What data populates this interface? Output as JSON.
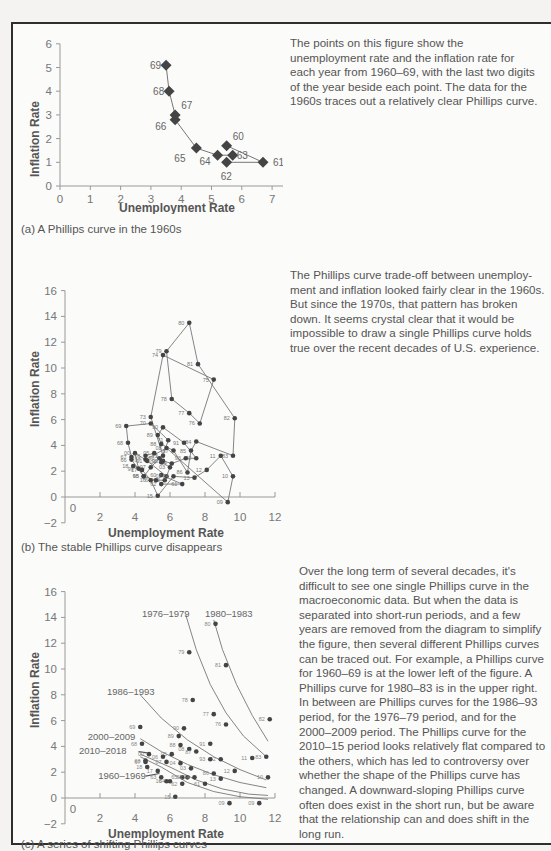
{
  "panels": [
    {
      "id": "a",
      "caption": "(a)  A Phillips curve in the 1960s",
      "description": "The points on this figure show the unemployment rate and the inflation rate for each year from 1960–69, with the last two digits of the year beside each point. The data for the 1960s traces out a relatively clear Phillips curve."
    },
    {
      "id": "b",
      "caption": "(b) The stable Phillips curve disappears",
      "description": "The Phillips curve trade-off between unemploy-ment and inflation looked fairly clear in the 1960s. But since the 1970s, that pattern has broken down. It seems crystal clear that it would be impossible to draw a single Phillips curve holds true over the recent decades of U.S. experience."
    },
    {
      "id": "c",
      "caption": "(c) A series of shifting Phillips curves",
      "description": "Over the long term of several decades, it's difficult to see one single Phillips curve in the macroeconomic data. But when the data is separated into short-run periods, and a few years are removed from the diagram to simplify the figure, then several different Phillips curves can be traced out. For example, a Phillips curve for 1960–69 is at the lower left of the figure. A Phillips curve for 1980–83 is in the upper right. In between are Phillips curves for the 1986–93 period, for the 1976–79 period, and for the 2000–2009 period. The Phillips curve for the 2010–15 period looks relatively flat compared to the others, which has led to controversy over whether the shape of the Phillips curve has changed. A downward-sloping Phillips curve often does exist in the short run, but be aware that the relationship can and does shift in the long run."
    }
  ],
  "colors": {
    "marker": "#444444",
    "line": "#777777",
    "text": "#555555",
    "frame": "#2e2e2e"
  },
  "chart_data": [
    {
      "type": "scatter",
      "title": "A Phillips curve in the 1960s",
      "xlabel": "Unemployment Rate",
      "ylabel": "Inflation Rate",
      "xlim": [
        0,
        8
      ],
      "ylim": [
        0,
        6
      ],
      "xticks": [
        0,
        1,
        2,
        3,
        4,
        5,
        6,
        7,
        8
      ],
      "yticks": [
        0,
        1,
        2,
        3,
        4,
        5,
        6
      ],
      "connected": true,
      "points": [
        {
          "label": "60",
          "x": 5.5,
          "y": 1.7
        },
        {
          "label": "61",
          "x": 6.7,
          "y": 1.0
        },
        {
          "label": "62",
          "x": 5.5,
          "y": 1.0
        },
        {
          "label": "63",
          "x": 5.7,
          "y": 1.3
        },
        {
          "label": "64",
          "x": 5.2,
          "y": 1.3
        },
        {
          "label": "65",
          "x": 4.5,
          "y": 1.6
        },
        {
          "label": "66",
          "x": 3.8,
          "y": 2.8
        },
        {
          "label": "67",
          "x": 3.8,
          "y": 3.0
        },
        {
          "label": "68",
          "x": 3.6,
          "y": 4.0
        },
        {
          "label": "69",
          "x": 3.5,
          "y": 5.1
        }
      ]
    },
    {
      "type": "scatter",
      "title": "The stable Phillips curve disappears",
      "xlabel": "Unemployment Rate",
      "ylabel": "Inflation Rate",
      "xlim": [
        0,
        12
      ],
      "ylim": [
        -2,
        16
      ],
      "xticks": [
        0,
        2,
        4,
        6,
        8,
        10,
        12
      ],
      "yticks": [
        -2,
        0,
        2,
        4,
        6,
        8,
        10,
        12,
        14,
        16
      ],
      "connected": true,
      "points": [
        {
          "label": "60",
          "x": 5.5,
          "y": 1.7
        },
        {
          "label": "61",
          "x": 6.7,
          "y": 1.0
        },
        {
          "label": "62",
          "x": 5.5,
          "y": 1.0
        },
        {
          "label": "63",
          "x": 5.7,
          "y": 1.3
        },
        {
          "label": "64",
          "x": 5.2,
          "y": 1.3
        },
        {
          "label": "65",
          "x": 4.5,
          "y": 1.6
        },
        {
          "label": "66",
          "x": 3.8,
          "y": 2.9
        },
        {
          "label": "67",
          "x": 3.8,
          "y": 3.1
        },
        {
          "label": "68",
          "x": 3.6,
          "y": 4.2
        },
        {
          "label": "69",
          "x": 3.5,
          "y": 5.5
        },
        {
          "label": "70",
          "x": 4.9,
          "y": 5.7
        },
        {
          "label": "71",
          "x": 5.9,
          "y": 4.4
        },
        {
          "label": "72",
          "x": 5.6,
          "y": 3.2
        },
        {
          "label": "73",
          "x": 4.9,
          "y": 6.2
        },
        {
          "label": "74",
          "x": 5.6,
          "y": 11.0
        },
        {
          "label": "75",
          "x": 8.5,
          "y": 9.1
        },
        {
          "label": "76",
          "x": 7.7,
          "y": 5.7
        },
        {
          "label": "77",
          "x": 7.1,
          "y": 6.5
        },
        {
          "label": "78",
          "x": 6.1,
          "y": 7.6
        },
        {
          "label": "79",
          "x": 5.8,
          "y": 11.3
        },
        {
          "label": "80",
          "x": 7.1,
          "y": 13.5
        },
        {
          "label": "81",
          "x": 7.6,
          "y": 10.3
        },
        {
          "label": "82",
          "x": 9.7,
          "y": 6.1
        },
        {
          "label": "83",
          "x": 9.6,
          "y": 3.2
        },
        {
          "label": "84",
          "x": 7.5,
          "y": 4.3
        },
        {
          "label": "85",
          "x": 7.2,
          "y": 3.6
        },
        {
          "label": "86",
          "x": 7.0,
          "y": 1.9
        },
        {
          "label": "87",
          "x": 6.2,
          "y": 3.6
        },
        {
          "label": "88",
          "x": 5.5,
          "y": 4.1
        },
        {
          "label": "89",
          "x": 5.3,
          "y": 4.8
        },
        {
          "label": "90",
          "x": 5.6,
          "y": 5.4
        },
        {
          "label": "91",
          "x": 6.8,
          "y": 4.2
        },
        {
          "label": "92",
          "x": 7.5,
          "y": 3.0
        },
        {
          "label": "93",
          "x": 6.9,
          "y": 3.0
        },
        {
          "label": "94",
          "x": 6.1,
          "y": 2.6
        },
        {
          "label": "95",
          "x": 5.6,
          "y": 2.8
        },
        {
          "label": "96",
          "x": 5.4,
          "y": 3.0
        },
        {
          "label": "97",
          "x": 4.9,
          "y": 2.3
        },
        {
          "label": "98",
          "x": 4.5,
          "y": 1.6
        },
        {
          "label": "99",
          "x": 4.2,
          "y": 2.2
        },
        {
          "label": "00",
          "x": 4.0,
          "y": 3.4
        },
        {
          "label": "01",
          "x": 4.7,
          "y": 2.8
        },
        {
          "label": "02",
          "x": 5.8,
          "y": 1.6
        },
        {
          "label": "03",
          "x": 6.0,
          "y": 2.3
        },
        {
          "label": "04",
          "x": 5.5,
          "y": 2.7
        },
        {
          "label": "05",
          "x": 5.1,
          "y": 3.4
        },
        {
          "label": "06",
          "x": 4.6,
          "y": 3.2
        },
        {
          "label": "07",
          "x": 4.6,
          "y": 2.9
        },
        {
          "label": "08",
          "x": 5.8,
          "y": 3.8
        },
        {
          "label": "09",
          "x": 9.3,
          "y": -0.4
        },
        {
          "label": "10",
          "x": 9.6,
          "y": 1.6
        },
        {
          "label": "11",
          "x": 8.9,
          "y": 3.2
        },
        {
          "label": "12",
          "x": 8.1,
          "y": 2.1
        },
        {
          "label": "13",
          "x": 7.4,
          "y": 1.5
        },
        {
          "label": "14",
          "x": 6.2,
          "y": 1.6
        },
        {
          "label": "15",
          "x": 5.3,
          "y": 0.1
        },
        {
          "label": "16",
          "x": 4.9,
          "y": 1.3
        },
        {
          "label": "17",
          "x": 4.4,
          "y": 2.1
        },
        {
          "label": "18",
          "x": 3.9,
          "y": 2.4
        }
      ]
    },
    {
      "type": "scatter",
      "title": "A series of shifting Phillips curves",
      "xlabel": "Unemployment Rate",
      "ylabel": "Inflation Rate",
      "xlim": [
        0,
        12
      ],
      "ylim": [
        -2,
        16
      ],
      "xticks": [
        0,
        2,
        4,
        6,
        8,
        10,
        12
      ],
      "yticks": [
        -2,
        0,
        2,
        4,
        6,
        8,
        10,
        12,
        14,
        16
      ],
      "curve_labels": [
        "1976–1979",
        "1980–1983",
        "1986–1993",
        "2000–2009",
        "2010–2018",
        "1960–1969"
      ],
      "points": [
        {
          "label": "80",
          "x": 8.6,
          "y": 13.5
        },
        {
          "label": "79",
          "x": 7.1,
          "y": 11.3
        },
        {
          "label": "81",
          "x": 9.2,
          "y": 10.3
        },
        {
          "label": "78",
          "x": 7.3,
          "y": 7.6
        },
        {
          "label": "77",
          "x": 8.5,
          "y": 6.5
        },
        {
          "label": "76",
          "x": 9.2,
          "y": 5.7
        },
        {
          "label": "82",
          "x": 11.7,
          "y": 6.1
        },
        {
          "label": "83",
          "x": 11.5,
          "y": 3.2
        },
        {
          "label": "69",
          "x": 4.3,
          "y": 5.5
        },
        {
          "label": "90",
          "x": 6.8,
          "y": 5.4
        },
        {
          "label": "89",
          "x": 6.5,
          "y": 4.8
        },
        {
          "label": "68",
          "x": 4.4,
          "y": 4.2
        },
        {
          "label": "91",
          "x": 8.3,
          "y": 4.2
        },
        {
          "label": "88",
          "x": 6.6,
          "y": 4.1
        },
        {
          "label": "08",
          "x": 7.1,
          "y": 3.8
        },
        {
          "label": "87",
          "x": 7.5,
          "y": 3.6
        },
        {
          "label": "00",
          "x": 4.8,
          "y": 3.4
        },
        {
          "label": "05",
          "x": 6.1,
          "y": 3.4
        },
        {
          "label": "06",
          "x": 5.6,
          "y": 3.2
        },
        {
          "label": "92",
          "x": 8.9,
          "y": 3.0
        },
        {
          "label": "93",
          "x": 8.3,
          "y": 3.0
        },
        {
          "label": "11",
          "x": 10.7,
          "y": 3.1
        },
        {
          "label": "66",
          "x": 4.6,
          "y": 2.9
        },
        {
          "label": "67",
          "x": 4.6,
          "y": 2.8
        },
        {
          "label": "07",
          "x": 5.8,
          "y": 2.8
        },
        {
          "label": "04",
          "x": 6.6,
          "y": 2.7
        },
        {
          "label": "03",
          "x": 7.2,
          "y": 2.3
        },
        {
          "label": "18",
          "x": 4.7,
          "y": 2.4
        },
        {
          "label": "17",
          "x": 5.3,
          "y": 2.1
        },
        {
          "label": "12",
          "x": 9.7,
          "y": 2.1
        },
        {
          "label": "86",
          "x": 8.5,
          "y": 1.9
        },
        {
          "label": "10",
          "x": 11.6,
          "y": 1.6
        },
        {
          "label": "13",
          "x": 8.9,
          "y": 1.5
        },
        {
          "label": "65",
          "x": 6.7,
          "y": 1.6
        },
        {
          "label": "63",
          "x": 5.5,
          "y": 1.6
        },
        {
          "label": "64",
          "x": 6.0,
          "y": 1.3
        },
        {
          "label": "16",
          "x": 5.8,
          "y": 1.3
        },
        {
          "label": "62",
          "x": 6.7,
          "y": 1.1
        },
        {
          "label": "02",
          "x": 7.0,
          "y": 1.6
        },
        {
          "label": "14",
          "x": 7.4,
          "y": 1.6
        },
        {
          "label": "61",
          "x": 8.0,
          "y": 1.1
        },
        {
          "label": "15",
          "x": 6.3,
          "y": 0.1
        },
        {
          "label": "09",
          "x": 9.4,
          "y": -0.4
        },
        {
          "label": "09b",
          "x": 11.1,
          "y": -0.4
        }
      ]
    }
  ]
}
